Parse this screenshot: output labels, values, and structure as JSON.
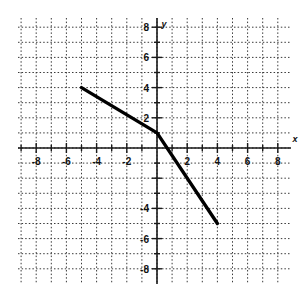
{
  "figure": {
    "title": "",
    "background_color": "#ffffff",
    "plot_area": {
      "left": 18,
      "top": 18,
      "right": 290,
      "bottom": 283
    },
    "origin": {
      "x": 157,
      "y": 148
    },
    "pixels_per_unit": 15.1,
    "grid": {
      "style": "dotted",
      "color": "#3a3a3a",
      "step": 1,
      "visible": true
    },
    "axes": {
      "color": "#1a1a1a",
      "x_label": "x",
      "y_label": "y",
      "x_label_pos": {
        "x": 295,
        "y": 142
      },
      "y_label_pos": {
        "x": 162,
        "y": 26
      }
    }
  },
  "chart_data": {
    "type": "line",
    "title": "",
    "xlabel": "x",
    "ylabel": "y",
    "xlim": [
      -9,
      9
    ],
    "ylim": [
      -9,
      9
    ],
    "grid": true,
    "legend": "none",
    "x_ticks": [
      -8,
      -6,
      -4,
      -2,
      2,
      4,
      6,
      8
    ],
    "y_ticks": [
      8,
      6,
      4,
      2,
      -4,
      -6,
      -8
    ],
    "x_tick_labels": [
      "-8",
      "-6",
      "-4",
      "-2",
      "2",
      "4",
      "6",
      "8"
    ],
    "y_tick_labels": [
      "8",
      "6",
      "4",
      "2",
      "-4",
      "-6",
      "-8"
    ],
    "x_minor_tick_step": 1,
    "y_minor_tick_step": 1,
    "series": [
      {
        "name": "piecewise-linear",
        "color": "#000000",
        "line_width": 3.4,
        "points": [
          {
            "x": -5.0,
            "y": 4.0
          },
          {
            "x": 0.0,
            "y": 1.0
          },
          {
            "x": 4.0,
            "y": -5.0
          }
        ]
      }
    ],
    "annotations": []
  },
  "ticks": {
    "x_labels": [
      {
        "text": "-8",
        "x": -8
      },
      {
        "text": "-6",
        "x": -6
      },
      {
        "text": "-4",
        "x": -4
      },
      {
        "text": "-2",
        "x": -2
      },
      {
        "text": "2",
        "x": 2
      },
      {
        "text": "4",
        "x": 4
      },
      {
        "text": "6",
        "x": 6
      },
      {
        "text": "8",
        "x": 8
      }
    ],
    "y_labels": [
      {
        "text": "8",
        "y": 8
      },
      {
        "text": "6",
        "y": 6
      },
      {
        "text": "4",
        "y": 4
      },
      {
        "text": "2",
        "y": 2
      },
      {
        "text": "-4",
        "y": -4
      },
      {
        "text": "-6",
        "y": -6
      },
      {
        "text": "-8",
        "y": -8
      }
    ]
  },
  "labels": {
    "x_axis_name": "x",
    "y_axis_name": "y"
  }
}
